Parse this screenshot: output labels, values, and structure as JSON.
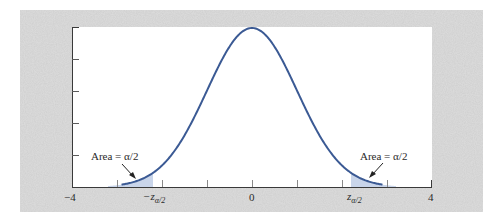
{
  "chart_data": {
    "type": "area",
    "title": "",
    "xlabel": "",
    "ylabel": "",
    "xlim": [
      -4,
      4
    ],
    "ylim": [
      0,
      0.4
    ],
    "x_ticks": [
      -4,
      -3,
      -2,
      -1,
      0,
      1,
      2,
      3,
      4
    ],
    "x_tick_labels": [
      {
        "x": -4,
        "text": "-4"
      },
      {
        "x": -2.2,
        "text": "-z",
        "sub": "α/2"
      },
      {
        "x": 0,
        "text": "0"
      },
      {
        "x": 2.2,
        "text": "z",
        "sub": "α/2"
      },
      {
        "x": 4,
        "text": "4"
      }
    ],
    "y_ticks": [
      0.08,
      0.16,
      0.24,
      0.32
    ],
    "y_tick_labels": [],
    "grid": false,
    "series": [
      {
        "name": "Standard normal pdf",
        "mean": 0,
        "sd": 1,
        "color": "#3b5a94"
      }
    ],
    "shaded_regions": [
      {
        "from": -4,
        "to": -2.2,
        "color": "#c9d5ea",
        "label": "Area = α/2"
      },
      {
        "from": 2.2,
        "to": 4,
        "color": "#c9d5ea",
        "label": "Area = α/2"
      }
    ],
    "annotations": [
      {
        "text": "Area = α/2",
        "side": "left"
      },
      {
        "text": "Area = α/2",
        "side": "right"
      }
    ]
  },
  "labels": {
    "left_area": "Area = α/2",
    "right_area": "Area = α/2",
    "x_min": "−4",
    "x_zero": "0",
    "x_max": "4",
    "neg_z": "−z",
    "pos_z": "z",
    "z_sub": "α/2"
  },
  "colors": {
    "curve": "#3b5a94",
    "shade": "#c9d5ea",
    "background_texture": "#d6d6d6",
    "plot_bg": "#ffffff",
    "axis": "#3a3a3a"
  }
}
